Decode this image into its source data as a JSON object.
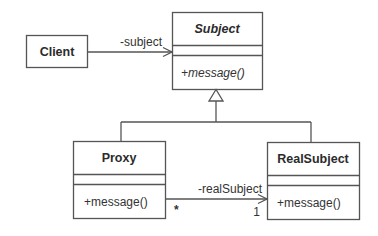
{
  "diagram": {
    "type": "uml-class-diagram",
    "pattern": "Proxy",
    "classes": {
      "client": {
        "name": "Client"
      },
      "subject": {
        "name": "Subject",
        "abstract": true,
        "operations": [
          "+message()"
        ]
      },
      "proxy": {
        "name": "Proxy",
        "operations": [
          "+message()"
        ]
      },
      "real_subject": {
        "name": "RealSubject",
        "operations": [
          "+message()"
        ]
      }
    },
    "associations": {
      "client_subject": {
        "role": "-subject"
      },
      "proxy_real": {
        "role": "-realSubject",
        "source_multiplicity": "*",
        "target_multiplicity": "1"
      }
    },
    "colors": {
      "stroke": "#555555",
      "text": "#2b2b2b",
      "background": "#ffffff"
    }
  }
}
